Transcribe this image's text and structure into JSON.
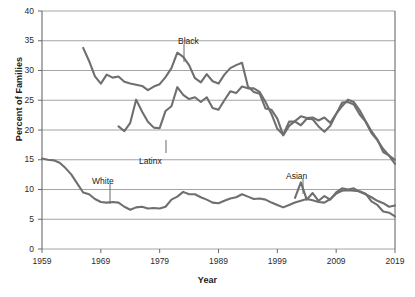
{
  "chart_data": {
    "type": "line",
    "title": "",
    "xlabel": "Year",
    "ylabel": "Percent of Families",
    "xlim": [
      1959,
      2019
    ],
    "ylim": [
      0,
      40
    ],
    "ytick_values": [
      0,
      5,
      10,
      15,
      20,
      25,
      30,
      35,
      40
    ],
    "ytick_labels": [
      "0",
      "5",
      "10",
      "15",
      "20",
      "25",
      "30",
      "35",
      "40"
    ],
    "xtick_values": [
      1959,
      1969,
      1979,
      1989,
      1999,
      2009,
      2019
    ],
    "xtick_labels": [
      "1959",
      "1969",
      "1979",
      "1989",
      "1999",
      "2009",
      "2019"
    ],
    "grid": "horizontal",
    "legend": "inline-annotations",
    "line_color": "#6f6f6f",
    "series": [
      {
        "name": "Black",
        "label": "Black",
        "x": [
          1966,
          1967,
          1968,
          1969,
          1970,
          1971,
          1972,
          1973,
          1974,
          1975,
          1976,
          1977,
          1978,
          1979,
          1980,
          1981,
          1982,
          1983,
          1984,
          1985,
          1986,
          1987,
          1988,
          1989,
          1990,
          1991,
          1992,
          1993,
          1994,
          1995,
          1996,
          1997,
          1998,
          1999,
          2000,
          2001,
          2002,
          2003,
          2004,
          2005,
          2006,
          2007,
          2008,
          2009,
          2010,
          2011,
          2012,
          2013,
          2014,
          2015,
          2016,
          2017,
          2018,
          2019
        ],
        "values": [
          33.8,
          31.6,
          29.0,
          27.8,
          29.3,
          28.8,
          29.0,
          28.1,
          27.8,
          27.6,
          27.4,
          26.7,
          27.3,
          27.7,
          28.9,
          30.4,
          33.0,
          32.3,
          30.9,
          28.7,
          28.0,
          29.4,
          28.2,
          27.8,
          29.3,
          30.4,
          30.9,
          31.3,
          27.3,
          26.4,
          26.1,
          23.6,
          23.4,
          21.9,
          19.1,
          20.7,
          21.5,
          22.3,
          22.0,
          22.1,
          21.6,
          22.1,
          21.2,
          22.7,
          24.0,
          25.1,
          24.7,
          23.3,
          21.5,
          19.8,
          18.4,
          16.3,
          15.7,
          15.0
        ]
      },
      {
        "name": "Latinx",
        "label": "Latinx",
        "x": [
          1972,
          1973,
          1974,
          1975,
          1976,
          1977,
          1978,
          1979,
          1980,
          1981,
          1982,
          1983,
          1984,
          1985,
          1986,
          1987,
          1988,
          1989,
          1990,
          1991,
          1992,
          1993,
          1994,
          1995,
          1996,
          1997,
          1998,
          1999,
          2000,
          2001,
          2002,
          2003,
          2004,
          2005,
          2006,
          2007,
          2008,
          2009,
          2010,
          2011,
          2012,
          2013,
          2014,
          2015,
          2016,
          2017,
          2018,
          2019
        ],
        "values": [
          20.6,
          19.8,
          21.2,
          25.1,
          23.1,
          21.4,
          20.4,
          20.3,
          23.2,
          24.0,
          27.2,
          25.9,
          25.2,
          25.5,
          24.7,
          25.5,
          23.7,
          23.4,
          25.0,
          26.5,
          26.2,
          27.3,
          27.0,
          27.0,
          26.4,
          24.7,
          22.7,
          20.2,
          19.2,
          21.4,
          21.4,
          20.8,
          21.9,
          21.8,
          20.6,
          19.7,
          20.7,
          22.7,
          24.6,
          24.7,
          24.3,
          22.6,
          21.4,
          19.5,
          18.3,
          16.8,
          15.7,
          14.3
        ]
      },
      {
        "name": "White",
        "label": "White",
        "x": [
          1959,
          1960,
          1961,
          1962,
          1963,
          1964,
          1965,
          1966,
          1967,
          1968,
          1969,
          1970,
          1971,
          1972,
          1973,
          1974,
          1975,
          1976,
          1977,
          1978,
          1979,
          1980,
          1981,
          1982,
          1983,
          1984,
          1985,
          1986,
          1987,
          1988,
          1989,
          1990,
          1991,
          1992,
          1993,
          1994,
          1995,
          1996,
          1997,
          1998,
          1999,
          2000,
          2001,
          2002,
          2003,
          2004,
          2005,
          2006,
          2007,
          2008,
          2009,
          2010,
          2011,
          2012,
          2013,
          2014,
          2015,
          2016,
          2017,
          2018,
          2019
        ],
        "values": [
          15.2,
          15.0,
          14.9,
          14.5,
          13.6,
          12.5,
          11.0,
          9.5,
          9.2,
          8.4,
          7.9,
          7.8,
          7.9,
          7.8,
          7.1,
          6.6,
          7.0,
          7.1,
          6.8,
          6.9,
          6.8,
          7.1,
          8.3,
          8.8,
          9.6,
          9.2,
          9.2,
          8.7,
          8.3,
          7.8,
          7.7,
          8.1,
          8.5,
          8.7,
          9.2,
          8.8,
          8.4,
          8.5,
          8.3,
          7.8,
          7.4,
          7.0,
          7.4,
          7.8,
          8.1,
          8.4,
          8.2,
          7.9,
          7.8,
          8.4,
          9.3,
          9.8,
          9.9,
          9.8,
          9.7,
          9.3,
          8.0,
          7.4,
          6.3,
          6.1,
          5.5
        ]
      },
      {
        "name": "Asian",
        "label": "Asian",
        "x": [
          2002,
          2003,
          2004,
          2005,
          2006,
          2007,
          2008,
          2009,
          2010,
          2011,
          2012,
          2013,
          2014,
          2015,
          2016,
          2017,
          2018,
          2019
        ],
        "values": [
          8.6,
          11.2,
          8.3,
          9.4,
          8.1,
          8.9,
          8.3,
          9.5,
          10.2,
          10.0,
          10.2,
          9.6,
          9.2,
          8.7,
          8.1,
          7.7,
          7.1,
          7.3
        ]
      }
    ],
    "annotations": [
      {
        "name": "Black",
        "text": "Black",
        "label_x": 178,
        "label_y": 36,
        "line_x": 184,
        "line_y0": 44,
        "line_y1": 62
      },
      {
        "name": "Latinx",
        "text": "Latinx",
        "label_x": 139,
        "label_y": 156,
        "line_x": 166,
        "line_y0": 140,
        "line_y1": 153
      },
      {
        "name": "White",
        "text": "White",
        "label_x": 92,
        "label_y": 176,
        "line_x": 110,
        "line_y0": 184,
        "line_y1": 204
      },
      {
        "name": "Asian",
        "text": "Asian",
        "label_x": 286,
        "label_y": 171,
        "line_x": 303,
        "line_y0": 179,
        "line_y1": 194
      }
    ]
  }
}
